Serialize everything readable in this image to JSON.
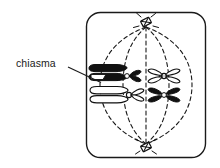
{
  "figure": {
    "kind": "biology-diagram",
    "background_color": "#ffffff",
    "ink_color": "#000000"
  },
  "labels": {
    "chiasma": "chiasma"
  },
  "cell": {
    "name": "cell-boundary",
    "shape": "rounded-rectangle",
    "x": 86,
    "y": 12,
    "width": 120,
    "height": 146,
    "corner_radius": 14,
    "stroke": "#1a1a1a",
    "stroke_width": 1.4,
    "fill": "#ffffff"
  },
  "spindle": {
    "name": "spindle-apparatus",
    "style": "dashed",
    "stroke": "#1a1a1a",
    "stroke_width": 1.1,
    "dash": "4,3",
    "fiber_count": 5,
    "top_pole": {
      "x": 146,
      "y": 26
    },
    "bottom_pole": {
      "x": 146,
      "y": 145
    },
    "equator_y": 85,
    "fiber_spread_x": [
      100,
      123,
      146,
      169,
      192
    ]
  },
  "centrioles": [
    {
      "name": "centriole-top",
      "x": 146,
      "y": 23,
      "rotation": -30
    },
    {
      "name": "centriole-bottom",
      "x": 146,
      "y": 146,
      "rotation": -30
    }
  ],
  "bivalents": [
    {
      "name": "bivalent-left",
      "center_x": 113,
      "chromosomes": [
        {
          "name": "chromosome-left-upper",
          "fill": "black",
          "center_y": 73,
          "has_chiasma": true
        },
        {
          "name": "chromosome-left-lower",
          "fill": "white",
          "center_y": 95,
          "has_chiasma": false
        }
      ]
    },
    {
      "name": "bivalent-right",
      "center_x": 164,
      "chromosomes": [
        {
          "name": "chromosome-right-upper",
          "fill": "white",
          "center_y": 75,
          "has_chiasma": false
        },
        {
          "name": "chromosome-right-lower",
          "fill": "black",
          "center_y": 95,
          "has_chiasma": false
        }
      ]
    }
  ],
  "annotations": [
    {
      "name": "chiasma-annotation",
      "text": "chiasma",
      "text_x": 16,
      "text_y": 57,
      "leader_from": {
        "x": 68,
        "y": 68
      },
      "leader_to": {
        "x": 101,
        "y": 83
      }
    }
  ]
}
